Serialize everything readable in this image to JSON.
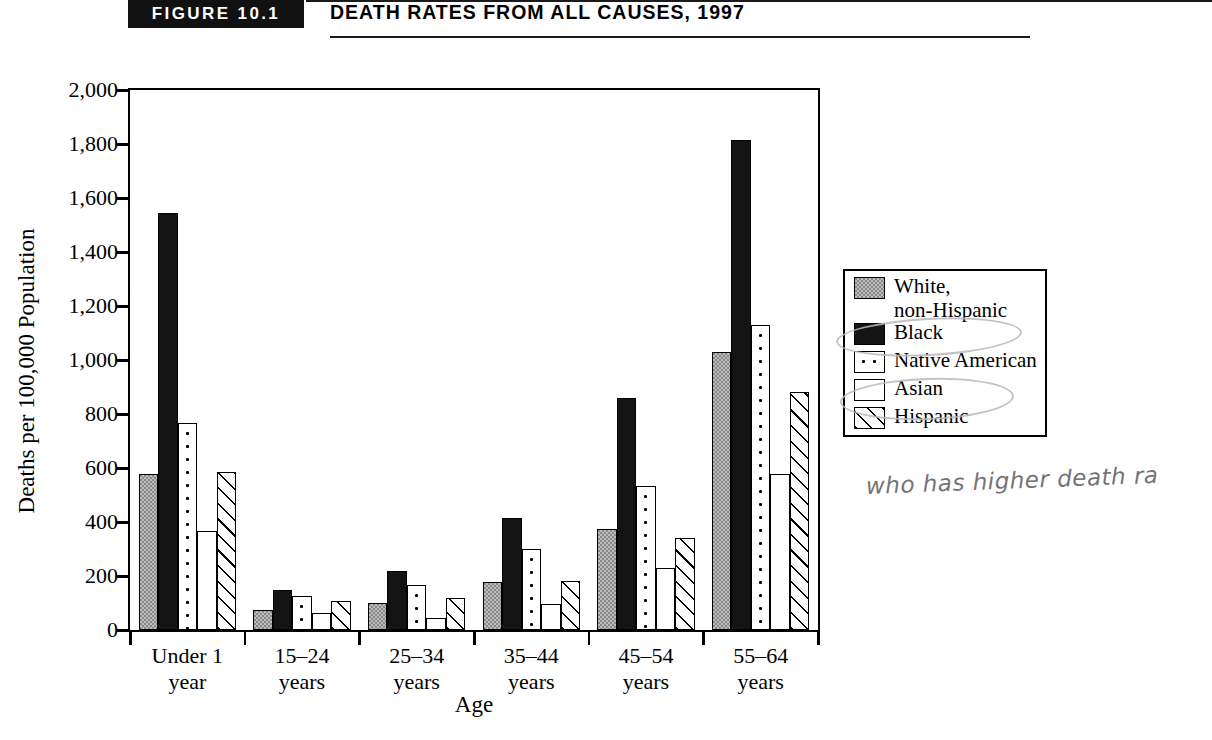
{
  "header": {
    "figure_badge": "FIGURE 10.1",
    "title": "DEATH RATES FROM ALL CAUSES, 1997"
  },
  "annotation": {
    "handwritten_note": "who has higher death ra"
  },
  "chart_data": {
    "type": "bar",
    "title": "Death Rates from All Causes, 1997",
    "xlabel": "Age",
    "ylabel": "Deaths per 100,000 Population",
    "ylim": [
      0,
      2000
    ],
    "ytick_labels": [
      "0",
      "200",
      "400",
      "600",
      "800",
      "1,000",
      "1,200",
      "1,400",
      "1,600",
      "1,800",
      "2,000"
    ],
    "ytick_values": [
      0,
      200,
      400,
      600,
      800,
      1000,
      1200,
      1400,
      1600,
      1800,
      2000
    ],
    "grid": false,
    "legend_position": "right",
    "categories": [
      "Under 1 year",
      "15–24 years",
      "25–34 years",
      "35–44 years",
      "45–54 years",
      "55–64 years"
    ],
    "category_lines": [
      [
        "Under 1",
        "year"
      ],
      [
        "15–24",
        "years"
      ],
      [
        "25–34",
        "years"
      ],
      [
        "35–44",
        "years"
      ],
      [
        "45–54",
        "years"
      ],
      [
        "55–64",
        "years"
      ]
    ],
    "series": [
      {
        "name": "White, non-Hispanic",
        "fill": "f-white-nh",
        "values": [
          578,
          75,
          100,
          178,
          375,
          1030
        ]
      },
      {
        "name": "Black",
        "fill": "f-black",
        "values": [
          1545,
          150,
          218,
          415,
          860,
          1815
        ]
      },
      {
        "name": "Native American",
        "fill": "f-native",
        "values": [
          768,
          125,
          168,
          300,
          535,
          1130
        ]
      },
      {
        "name": "Asian",
        "fill": "f-asian",
        "values": [
          365,
          62,
          45,
          95,
          230,
          578
        ]
      },
      {
        "name": "Hispanic",
        "fill": "f-hispanic",
        "values": [
          585,
          108,
          118,
          180,
          340,
          880
        ]
      }
    ],
    "legend": [
      {
        "label_lines": [
          "White,",
          "non-Hispanic"
        ],
        "fill": "f-white-nh"
      },
      {
        "label_lines": [
          "Black"
        ],
        "fill": "f-black"
      },
      {
        "label_lines": [
          "Native American"
        ],
        "fill": "f-native"
      },
      {
        "label_lines": [
          "Asian"
        ],
        "fill": "f-asian"
      },
      {
        "label_lines": [
          "Hispanic"
        ],
        "fill": "f-hispanic"
      }
    ],
    "colors": {
      "white_non_hispanic": "#8a8a8a",
      "black": "#141414",
      "axis": "#000000",
      "background": "#ffffff"
    }
  }
}
